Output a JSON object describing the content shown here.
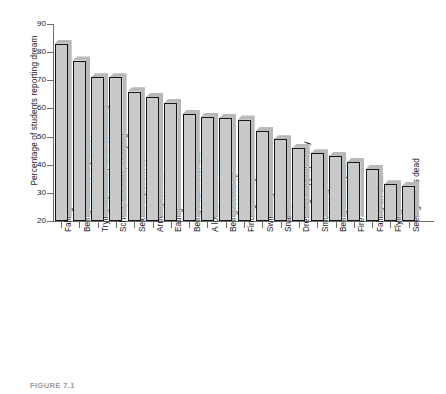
{
  "chart_data": {
    "type": "bar",
    "title": "",
    "xlabel": "",
    "ylabel": "Percentage of students reporting dream",
    "ylim": [
      20,
      90
    ],
    "yticks": [
      20,
      30,
      40,
      50,
      60,
      70,
      80,
      90
    ],
    "grid": false,
    "legend": null,
    "categories": [
      "Falling",
      "Being attacked or pursued",
      "Trying repeatedly to do something",
      "School, teachers, studying",
      "Sexual experiences",
      "Arriving too late",
      "Eating",
      "Being frozen with fear",
      "A loved one is dead",
      "Being locked up",
      "Finding money",
      "Swimming",
      "Snakes",
      "Dressing inappropriately",
      "Smothering",
      "Being nude in public",
      "Fire",
      "Failing an exam",
      "Flying",
      "Seeing self as dead"
    ],
    "values": [
      83,
      77,
      71,
      71,
      66,
      64,
      62,
      58,
      57,
      56.5,
      56,
      52,
      49,
      46,
      44,
      43,
      41,
      38.5,
      33,
      32.5
    ]
  },
  "figure": {
    "caption": "FIGURE 7.1",
    "bar_fill_color": "#c9c9c9",
    "bar_shadow_color": "#b9b9b9",
    "bar_outline_color": "#151515",
    "axis_color": "#6e6e6e",
    "background_color": "#ffffff"
  }
}
